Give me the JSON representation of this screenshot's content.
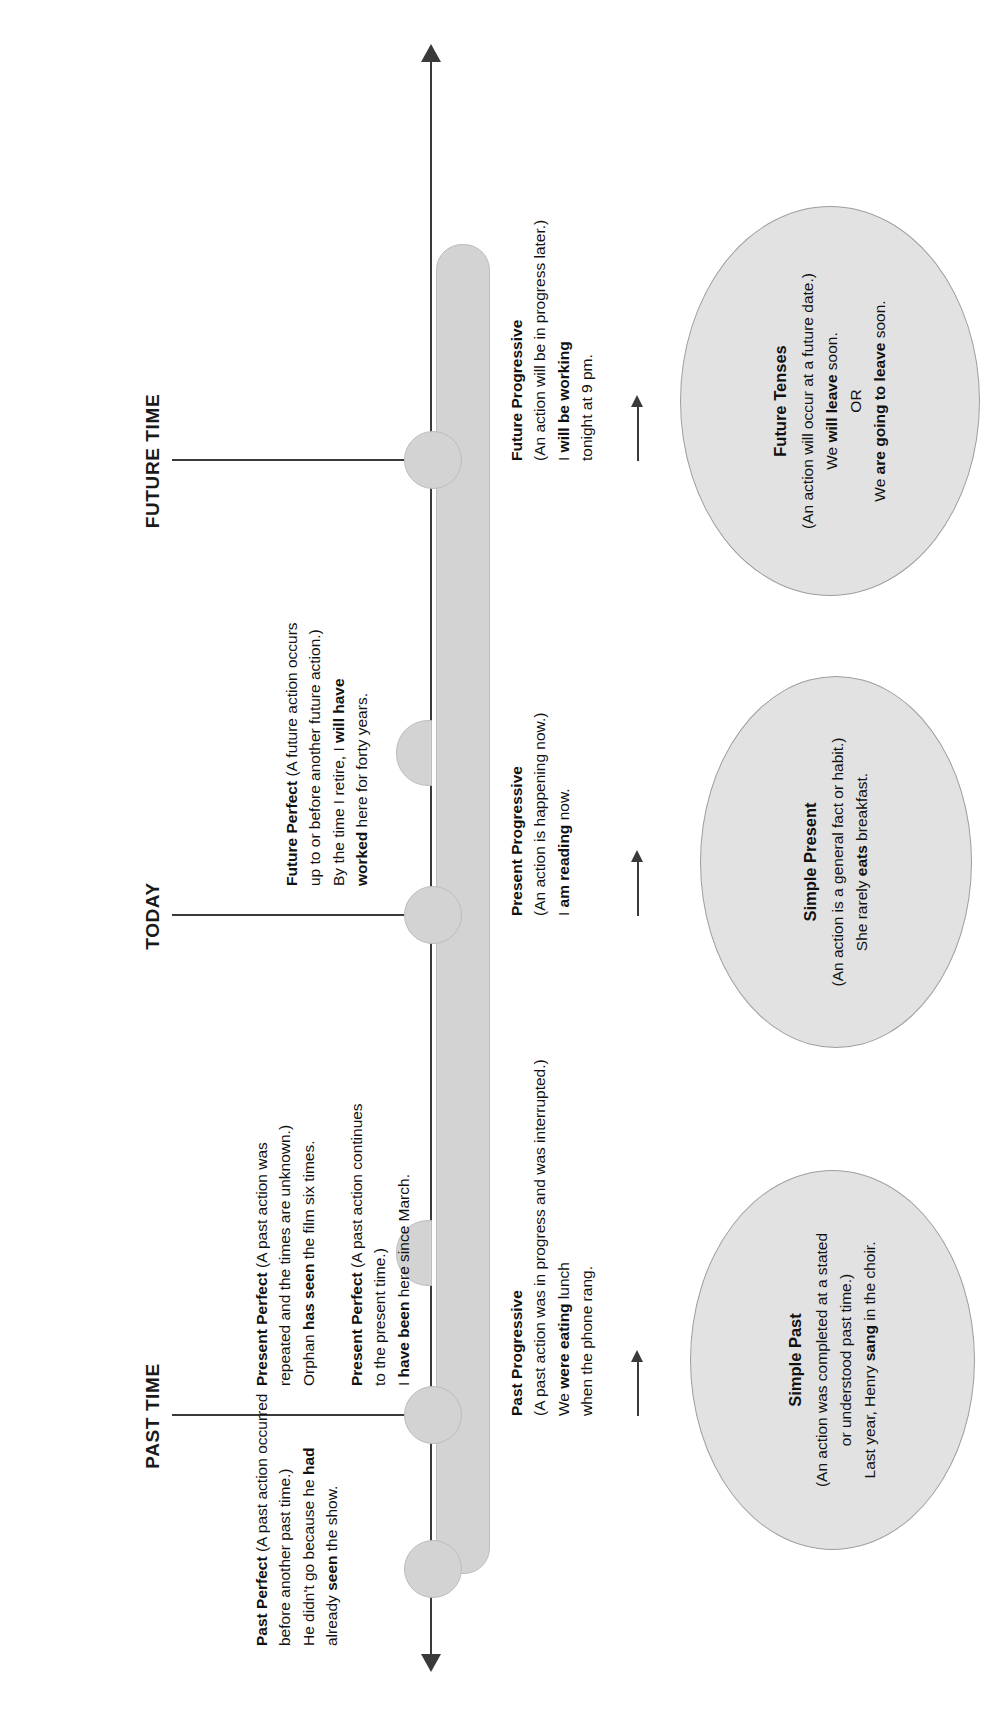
{
  "diagram": {
    "accent_color": "#d3d3d3",
    "ellipse_fill": "#e2e2e2",
    "line_color": "#3a3a3a"
  },
  "timeline": {
    "headings": [
      {
        "id": "past",
        "label": "PAST TIME"
      },
      {
        "id": "today",
        "label": "TODAY"
      },
      {
        "id": "future",
        "label": "FUTURE TIME"
      }
    ]
  },
  "notes_above": [
    {
      "id": "past-perfect",
      "title": "Past Perfect",
      "paren_line1": "(A past action occurred",
      "paren_line2": "before another past time.)",
      "example_pre": "He didn't go because he ",
      "example_bold": "had",
      "example_line2_pre": "already ",
      "example_line2_bold": "seen",
      "example_line2_post": " the show."
    },
    {
      "id": "present-perfect-repeated",
      "title": "Present Perfect",
      "paren_line1": "(A past action was",
      "paren_line2": "repeated and the times are unknown.)",
      "example_pre": "Orphan ",
      "example_bold": "has seen",
      "example_post": " the film six times."
    },
    {
      "id": "present-perfect-continues",
      "title": "Present Perfect",
      "paren_line1": "(A past action continues",
      "paren_line2": "to the present time.)",
      "example_pre": "I ",
      "example_bold": "have been",
      "example_post": " here since March."
    },
    {
      "id": "future-perfect",
      "title": "Future Perfect",
      "paren_line1": "(A future action occurs",
      "paren_line2": "up to or before another future action.)",
      "example_pre": "By the time I retire, I ",
      "example_bold": "will have",
      "example_line2_bold": "worked",
      "example_line2_post": " here for forty years."
    }
  ],
  "notes_below": [
    {
      "id": "past-progressive",
      "title": "Past Progressive",
      "paren": "(A past action was in progress and was interrupted.)",
      "example_pre": "We ",
      "example_bold": "were eating",
      "example_post": " lunch",
      "example_line2": "when the phone rang."
    },
    {
      "id": "present-progressive",
      "title": "Present Progressive",
      "paren": "(An action is happening now.)",
      "example_pre": "I ",
      "example_bold": "am reading",
      "example_post": " now."
    },
    {
      "id": "future-progressive",
      "title": "Future Progressive",
      "paren": "(An action will be in progress later.)",
      "example_pre": "I ",
      "example_bold": "will be working",
      "example_line2": "tonight at 9 pm."
    }
  ],
  "ellipses": [
    {
      "id": "simple-past",
      "title": "Simple Past",
      "line1": "(An action was completed at a stated",
      "line2": "or understood past time.)",
      "example_pre": "Last year, Henry ",
      "example_bold": "sang",
      "example_post": " in the choir."
    },
    {
      "id": "simple-present",
      "title": "Simple Present",
      "line1": "(An action is a general fact or habit.)",
      "example_pre": "She rarely ",
      "example_bold": "eats",
      "example_post": " breakfast."
    },
    {
      "id": "future-tenses",
      "title": "Future Tenses",
      "line1": "(An action will occur at a future date.)",
      "example1_pre": "We ",
      "example1_bold": "will leave",
      "example1_post": " soon.",
      "or_label": "OR",
      "example2_pre": "We ",
      "example2_bold": "are going to leave",
      "example2_post": " soon."
    }
  ]
}
